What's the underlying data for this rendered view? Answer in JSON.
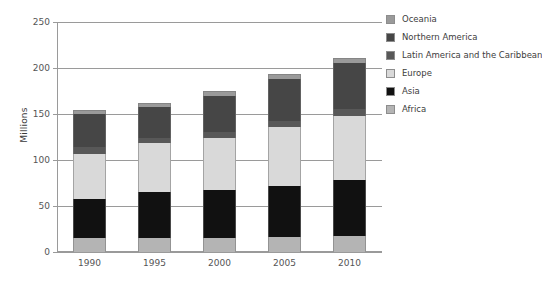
{
  "chart_data": {
    "type": "bar",
    "stacked": true,
    "title": "",
    "xlabel": "",
    "ylabel": "Millions",
    "ylim": [
      0,
      250
    ],
    "yticks": [
      0,
      50,
      100,
      150,
      200,
      250
    ],
    "grid": true,
    "legend_position": "right",
    "categories": [
      "1990",
      "1995",
      "2000",
      "2005",
      "2010"
    ],
    "series": [
      {
        "name": "Africa",
        "color": "#b4b4b4",
        "values": [
          15,
          15,
          15,
          16,
          17
        ]
      },
      {
        "name": "Asia",
        "color": "#111111",
        "values": [
          43,
          50,
          52,
          56,
          61
        ]
      },
      {
        "name": "Europe",
        "color": "#d9d9d9",
        "values": [
          49,
          53,
          57,
          64,
          70
        ]
      },
      {
        "name": "Latin America and the Caribbean",
        "color": "#585858",
        "values": [
          7,
          6,
          6,
          6,
          7
        ]
      },
      {
        "name": "Northern America",
        "color": "#464646",
        "values": [
          36,
          34,
          40,
          46,
          50
        ]
      },
      {
        "name": "Oceania",
        "color": "#9a9a9a",
        "values": [
          4,
          4,
          5,
          6,
          6
        ]
      }
    ],
    "totals": [
      154,
      162,
      175,
      194,
      211
    ]
  },
  "legend": {
    "items": [
      {
        "label": "Oceania",
        "color": "#9a9a9a"
      },
      {
        "label": "Northern America",
        "color": "#464646"
      },
      {
        "label": "Latin America and the Caribbean",
        "color": "#585858"
      },
      {
        "label": "Europe",
        "color": "#d9d9d9"
      },
      {
        "label": "Asia",
        "color": "#111111"
      },
      {
        "label": "Africa",
        "color": "#b4b4b4"
      }
    ]
  }
}
